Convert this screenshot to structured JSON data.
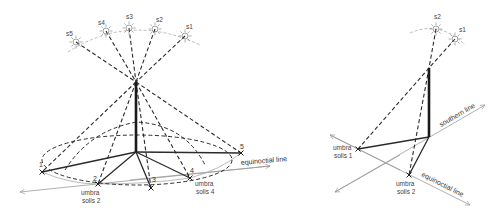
{
  "left_figure": {
    "suns": [
      {
        "label": "s5",
        "x": 76,
        "y": 42
      },
      {
        "label": "s4",
        "x": 106,
        "y": 31
      },
      {
        "label": "s3",
        "x": 129,
        "y": 28
      },
      {
        "label": "s2",
        "x": 155,
        "y": 29
      },
      {
        "label": "s1",
        "x": 185,
        "y": 36
      }
    ],
    "points": [
      {
        "label": "1",
        "x": 42,
        "y": 172
      },
      {
        "label": "2",
        "x": 98,
        "y": 184
      },
      {
        "label": "3",
        "x": 151,
        "y": 188
      },
      {
        "label": "4",
        "x": 190,
        "y": 178
      },
      {
        "label": "5",
        "x": 241,
        "y": 153
      }
    ],
    "umbra_labels": [
      {
        "line1": "umbra",
        "line2": "solis 2"
      },
      {
        "line1": "umbra",
        "line2": "solis 4"
      }
    ],
    "line_label": "equinoctial line"
  },
  "right_figure": {
    "suns": [
      {
        "label": "s2",
        "x": 436,
        "y": 29
      },
      {
        "label": "s1",
        "x": 455,
        "y": 39
      }
    ],
    "umbra_labels": [
      {
        "line1": "umbra",
        "line2": "solis 1"
      },
      {
        "line1": "umbra",
        "line2": "solis 2"
      }
    ],
    "southern_label": "southern line",
    "equinoctial_label": "equinoctial line"
  },
  "colors": {
    "ink": "#2b2b2b",
    "arc": "#aaaaaa",
    "ground_line": "#9a9a9a"
  }
}
